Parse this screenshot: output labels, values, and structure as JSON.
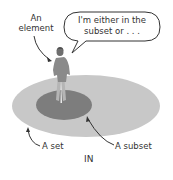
{
  "diagram": {
    "labels": {
      "element_line1": "An",
      "element_line2": "element",
      "set": "A set",
      "subset": "A subset",
      "caption": "IN"
    },
    "speech_bubble": {
      "line1": "I'm either in the",
      "line2": "subset or . . ."
    },
    "colors": {
      "set_fill": "#c8c8c8",
      "subset_fill": "#7d7d7d",
      "figure_fill": "#8a8a8a",
      "stroke": "#333333",
      "background": "#ffffff"
    },
    "shapes": {
      "set": {
        "type": "ellipse",
        "cx": 86,
        "cy": 106,
        "rx": 74,
        "ry": 31
      },
      "subset": {
        "type": "ellipse",
        "cx": 64,
        "cy": 105,
        "rx": 28,
        "ry": 15
      },
      "element": {
        "type": "person",
        "x": 61,
        "y_top": 48,
        "y_feet": 103
      }
    }
  }
}
